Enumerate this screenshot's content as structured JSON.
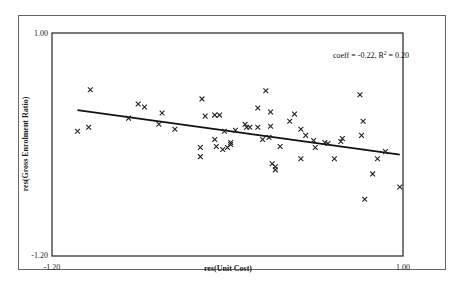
{
  "chart_data": {
    "type": "scatter",
    "title": "",
    "xlabel": "res(Unit Cost)",
    "ylabel": "res(Gross Enrolment Ratio)",
    "xlim": [
      -1.2,
      1.0
    ],
    "ylim": [
      -1.2,
      1.0
    ],
    "x_tick_labels": [
      "-1.20",
      "1.00"
    ],
    "y_tick_labels": [
      "1.00",
      "-1.20"
    ],
    "grid": false,
    "legend": null,
    "marker": "x",
    "annotation": {
      "text_prefix": "coeff = -0.22, R",
      "superscript": "2",
      "text_suffix": " = 0.20",
      "coeff": -0.22,
      "r_squared": 0.2
    },
    "regression_line": {
      "x": [
        -1.04,
        0.98
      ],
      "y": [
        0.24,
        -0.2
      ],
      "slope": -0.22
    },
    "series": [
      {
        "name": "observations",
        "points": [
          [
            -1.04,
            0.03
          ],
          [
            -0.97,
            0.07
          ],
          [
            -0.96,
            0.44
          ],
          [
            -0.72,
            0.16
          ],
          [
            -0.66,
            0.3
          ],
          [
            -0.62,
            0.27
          ],
          [
            -0.53,
            0.1
          ],
          [
            -0.51,
            0.21
          ],
          [
            -0.43,
            0.05
          ],
          [
            -0.27,
            -0.22
          ],
          [
            -0.27,
            -0.13
          ],
          [
            -0.26,
            0.35
          ],
          [
            -0.24,
            0.18
          ],
          [
            -0.18,
            0.19
          ],
          [
            -0.18,
            -0.05
          ],
          [
            -0.17,
            -0.12
          ],
          [
            -0.15,
            0.19
          ],
          [
            -0.13,
            -0.15
          ],
          [
            -0.12,
            0.03
          ],
          [
            -0.1,
            -0.13
          ],
          [
            -0.08,
            -0.08
          ],
          [
            -0.08,
            -0.1
          ],
          [
            -0.05,
            0.04
          ],
          [
            0.01,
            0.1
          ],
          [
            0.02,
            0.07
          ],
          [
            0.04,
            0.07
          ],
          [
            0.09,
            0.26
          ],
          [
            0.09,
            0.07
          ],
          [
            0.12,
            -0.05
          ],
          [
            0.14,
            0.43
          ],
          [
            0.17,
            0.22
          ],
          [
            0.17,
            0.08
          ],
          [
            0.16,
            -0.03
          ],
          [
            0.18,
            -0.29
          ],
          [
            0.2,
            -0.32
          ],
          [
            0.2,
            -0.35
          ],
          [
            0.23,
            -0.12
          ],
          [
            0.29,
            0.13
          ],
          [
            0.32,
            0.2
          ],
          [
            0.36,
            0.05
          ],
          [
            0.36,
            -0.24
          ],
          [
            0.39,
            -0.01
          ],
          [
            0.44,
            -0.06
          ],
          [
            0.45,
            -0.13
          ],
          [
            0.51,
            -0.08
          ],
          [
            0.53,
            -0.09
          ],
          [
            0.57,
            -0.24
          ],
          [
            0.61,
            -0.07
          ],
          [
            0.62,
            -0.04
          ],
          [
            0.73,
            0.39
          ],
          [
            0.75,
            0.13
          ],
          [
            0.74,
            -0.01
          ],
          [
            0.84,
            -0.24
          ],
          [
            0.81,
            -0.39
          ],
          [
            0.76,
            -0.64
          ],
          [
            0.98,
            -0.52
          ],
          [
            0.89,
            -0.17
          ]
        ]
      }
    ]
  }
}
